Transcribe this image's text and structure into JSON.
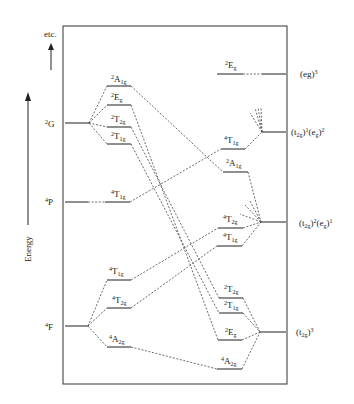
{
  "diagram": {
    "axis": {
      "label": "Energy",
      "extra_label": "etc."
    },
    "free_ion_terms": [
      {
        "id": "2G",
        "mult": "2",
        "letter": "G"
      },
      {
        "id": "4P",
        "mult": "4",
        "letter": "P"
      },
      {
        "id": "4F",
        "mult": "4",
        "letter": "F"
      }
    ],
    "weak_field_levels": [
      {
        "mult": "2",
        "sym": "A",
        "sub": "1g"
      },
      {
        "mult": "2",
        "sym": "E",
        "sub": "g"
      },
      {
        "mult": "2",
        "sym": "T",
        "sub": "2g"
      },
      {
        "mult": "2",
        "sym": "T",
        "sub": "1g"
      },
      {
        "mult": "4",
        "sym": "T",
        "sub": "1g"
      },
      {
        "mult": "4",
        "sym": "T",
        "sub": "1g"
      },
      {
        "mult": "4",
        "sym": "T",
        "sub": "2g"
      },
      {
        "mult": "4",
        "sym": "A",
        "sub": "2g"
      }
    ],
    "strong_field_levels": [
      {
        "mult": "2",
        "sym": "E",
        "sub": "g"
      },
      {
        "mult": "4",
        "sym": "T",
        "sub": "1g"
      },
      {
        "mult": "2",
        "sym": "A",
        "sub": "1g"
      },
      {
        "mult": "4",
        "sym": "T",
        "sub": "2g"
      },
      {
        "mult": "4",
        "sym": "T",
        "sub": "1g"
      },
      {
        "mult": "2",
        "sym": "T",
        "sub": "2g"
      },
      {
        "mult": "2",
        "sym": "T",
        "sub": "1g"
      },
      {
        "mult": "2",
        "sym": "E",
        "sub": "g"
      },
      {
        "mult": "4",
        "sym": "A",
        "sub": "2g"
      }
    ],
    "configurations": [
      {
        "id": "eg3",
        "text": "(eg)",
        "sup": "3"
      },
      {
        "id": "t2g1eg2",
        "a": "(t",
        "a_sub": "2g",
        "a_close": ")",
        "a_sup": "1",
        "b": "(e",
        "b_sub": "g",
        "b_close": ")",
        "b_sup": "2"
      },
      {
        "id": "t2g2eg1",
        "a": "(t",
        "a_sub": "2g",
        "a_close": ")",
        "a_sup": "2",
        "b": "(e",
        "b_sub": "g",
        "b_close": ")",
        "b_sup": "1"
      },
      {
        "id": "t2g3",
        "a": "(t",
        "a_sub": "2g",
        "a_close": ")",
        "a_sup": "3"
      }
    ]
  }
}
